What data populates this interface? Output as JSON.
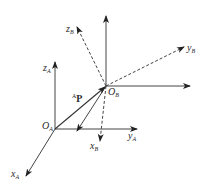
{
  "diagram": {
    "frame_A": {
      "origin_label": {
        "main": "O",
        "sub": "A"
      },
      "axes": [
        {
          "name": "x",
          "sub": "A"
        },
        {
          "name": "y",
          "sub": "A"
        },
        {
          "name": "z",
          "sub": "A"
        }
      ]
    },
    "frame_B": {
      "origin_label": {
        "main": "O",
        "sub": "B"
      },
      "axes": [
        {
          "name": "x",
          "sub": "B"
        },
        {
          "name": "y",
          "sub": "B"
        },
        {
          "name": "z",
          "sub": "B"
        }
      ]
    },
    "vector": {
      "sup": "A",
      "main": "P"
    },
    "colors": {
      "stroke": "#333333",
      "background": "#ffffff"
    }
  }
}
